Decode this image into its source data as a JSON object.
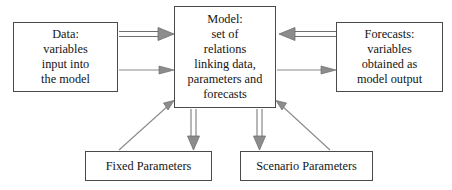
{
  "diagram": {
    "stroke_color": "#6e6e6e",
    "box_border_color": "#4a4a4a",
    "text_color": "#141414",
    "background_color": "#ffffff",
    "nodes": {
      "data": {
        "label": "Data:\nvariables\ninput into\nthe model"
      },
      "model": {
        "label": "Model:\nset of\nrelations\nlinking data,\nparameters and\nforecasts"
      },
      "forecasts": {
        "label": "Forecasts:\nvariables\nobtained as\nmodel output"
      },
      "fixed_parameters": {
        "label": "Fixed Parameters"
      },
      "scenario_parameters": {
        "label": "Scenario Parameters"
      }
    },
    "edges": [
      {
        "name": "data-to-model-thick",
        "from": "data",
        "to": "model",
        "style": "double-line",
        "direction": "right"
      },
      {
        "name": "data-to-model-thin",
        "from": "data",
        "to": "model",
        "style": "single-line",
        "direction": "right"
      },
      {
        "name": "forecasts-to-model-thick",
        "from": "forecasts",
        "to": "model",
        "style": "double-line",
        "direction": "left"
      },
      {
        "name": "model-to-forecasts-thin",
        "from": "model",
        "to": "forecasts",
        "style": "single-line",
        "direction": "right"
      },
      {
        "name": "model-to-fixed-parameters",
        "from": "model",
        "to": "fixed_parameters",
        "style": "double-line",
        "direction": "down"
      },
      {
        "name": "model-to-scenario-parameters",
        "from": "model",
        "to": "scenario_parameters",
        "style": "double-line",
        "direction": "down"
      },
      {
        "name": "fixed-parameters-to-model",
        "from": "fixed_parameters",
        "to": "model",
        "style": "single-line",
        "direction": "up-right"
      },
      {
        "name": "scenario-parameters-to-model",
        "from": "scenario_parameters",
        "to": "model",
        "style": "single-line",
        "direction": "up-left"
      }
    ]
  }
}
